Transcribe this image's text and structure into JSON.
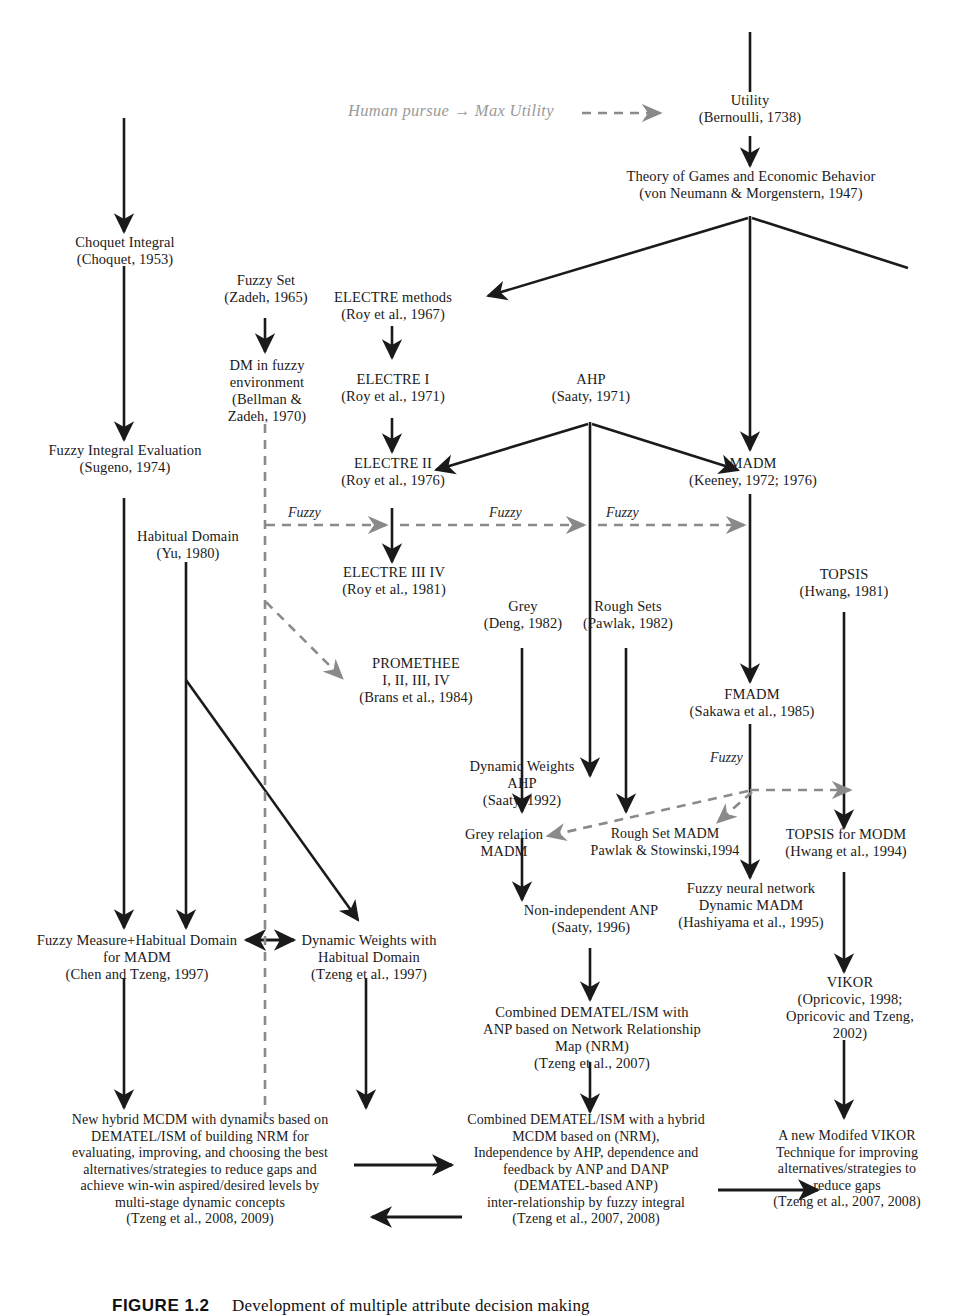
{
  "figure": {
    "banner_text": "Human pursue → Max Utility",
    "caption_label": "FIGURE 1.2",
    "caption_text": "Development of multiple attribute decision making"
  },
  "edge_labels": {
    "fuzzy": "Fuzzy"
  },
  "colors": {
    "ink": "#1a1a1a",
    "dashed_gray": "#8a8a8a",
    "background": "#ffffff"
  },
  "nodes": [
    {
      "id": "utility",
      "text": "Utility\n(Bernoulli, 1738)"
    },
    {
      "id": "theory-games",
      "text": "Theory of Games and Economic Behavior\n(von Neumann & Morgenstern, 1947)"
    },
    {
      "id": "choquet",
      "text": "Choquet Integral\n(Choquet, 1953)"
    },
    {
      "id": "fuzzy-set",
      "text": "Fuzzy Set\n(Zadeh, 1965)"
    },
    {
      "id": "electre-methods",
      "text": "ELECTRE methods\n(Roy et al., 1967)"
    },
    {
      "id": "dm-fuzzy-env",
      "text": "DM in fuzzy\nenvironment\n(Bellman &\nZadeh, 1970)"
    },
    {
      "id": "electre-1",
      "text": "ELECTRE  I\n(Roy et al., 1971)"
    },
    {
      "id": "ahp",
      "text": "AHP\n(Saaty, 1971)"
    },
    {
      "id": "madm",
      "text": "MADM\n(Keeney, 1972; 1976)"
    },
    {
      "id": "fuzzy-integral",
      "text": "Fuzzy Integral Evaluation\n(Sugeno, 1974)"
    },
    {
      "id": "electre-2",
      "text": "ELECTRE II\n(Roy et al., 1976)"
    },
    {
      "id": "habitual-domain",
      "text": "Habitual Domain\n(Yu, 1980)"
    },
    {
      "id": "electre-3-4",
      "text": "ELECTRE III IV\n(Roy et al., 1981)"
    },
    {
      "id": "topsis",
      "text": "TOPSIS\n(Hwang, 1981)"
    },
    {
      "id": "grey",
      "text": "Grey\n(Deng, 1982)"
    },
    {
      "id": "rough-sets",
      "text": "Rough Sets\n(Pawlak, 1982)"
    },
    {
      "id": "promethee",
      "text": "PROMETHEE\nI, II, III, IV\n(Brans et al., 1984)"
    },
    {
      "id": "fmadm",
      "text": "FMADM\n(Sakawa et al., 1985)"
    },
    {
      "id": "dynamic-ahp",
      "text": "Dynamic Weights\nAHP\n(Saaty, 1992)"
    },
    {
      "id": "grey-relation",
      "text": "Grey relation\nMADM"
    },
    {
      "id": "rough-set-madm",
      "text": "Rough Set MADM\nPawlak & Stowinski,1994"
    },
    {
      "id": "topsis-modm",
      "text": "TOPSIS for MODM\n(Hwang et al., 1994)"
    },
    {
      "id": "fuzzy-neural",
      "text": "Fuzzy neural network\nDynamic MADM\n(Hashiyama et al., 1995)"
    },
    {
      "id": "non-indep-anp",
      "text": "Non-independent ANP\n(Saaty, 1996)"
    },
    {
      "id": "fuzzy-measure-hd",
      "text": "Fuzzy Measure+Habitual Domain\nfor MADM\n(Chen and Tzeng, 1997)"
    },
    {
      "id": "dyn-weights-hd",
      "text": "Dynamic Weights with\nHabitual Domain\n(Tzeng et al., 1997)"
    },
    {
      "id": "vikor",
      "text": "VIKOR\n(Opricovic, 1998;\nOpricovic and Tzeng,\n2002)"
    },
    {
      "id": "combined-nrm",
      "text": "Combined DEMATEL/ISM with\nANP based on Network Relationship\nMap (NRM)\n(Tzeng et al., 2007)"
    },
    {
      "id": "new-hybrid-mcdm",
      "text": "New hybrid MCDM with dynamics based on\nDEMATEL/ISM of building NRM for\nevaluating, improving, and choosing the best\nalternatives/strategies to reduce gaps and\nachieve win-win aspired/desired levels by\nmulti-stage dynamic concepts\n(Tzeng et al., 2008, 2009)"
    },
    {
      "id": "combined-hybrid",
      "text": "Combined DEMATEL/ISM with a hybrid\nMCDM based on (NRM),\nIndependence by AHP, dependence and\nfeedback by ANP and DANP\n(DEMATEL-based ANP)\ninter-relationship by fuzzy integral\n(Tzeng et al., 2007, 2008)"
    },
    {
      "id": "modified-vikor",
      "text": "A new Modifed VIKOR\nTechnique for improving\nalternatives/strategies to\nreduce gaps\n(Tzeng et al., 2007, 2008)"
    }
  ]
}
